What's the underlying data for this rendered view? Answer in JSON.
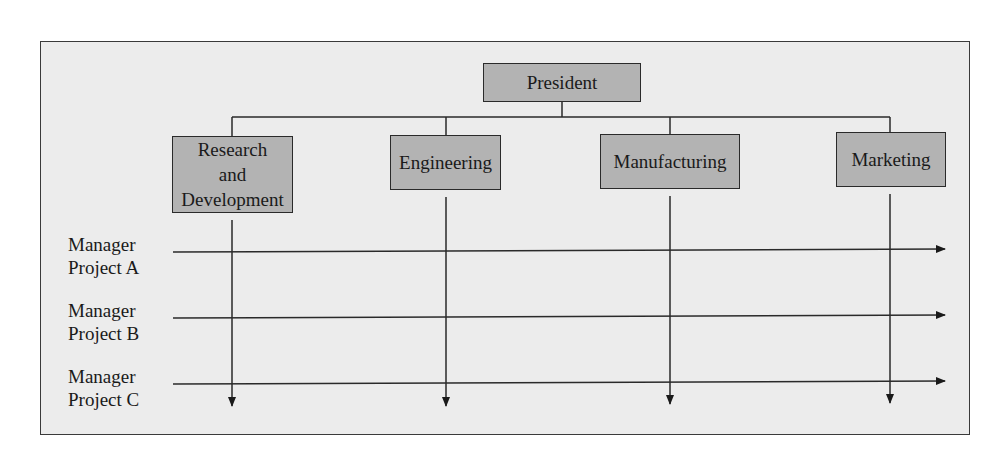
{
  "diagram": {
    "type": "matrix-organization-chart",
    "top": {
      "label": "President"
    },
    "departments": [
      {
        "label": "Research and Development",
        "lines": [
          "Research",
          "and",
          "Development"
        ]
      },
      {
        "label": "Engineering"
      },
      {
        "label": "Manufacturing"
      },
      {
        "label": "Marketing"
      }
    ],
    "project_managers": [
      {
        "line1": "Manager",
        "line2": "Project A"
      },
      {
        "line1": "Manager",
        "line2": "Project B"
      },
      {
        "line1": "Manager",
        "line2": "Project C"
      }
    ],
    "colors": {
      "box_fill": "#b3b3b3",
      "background": "#ececec",
      "line": "#2a2a2a"
    }
  }
}
